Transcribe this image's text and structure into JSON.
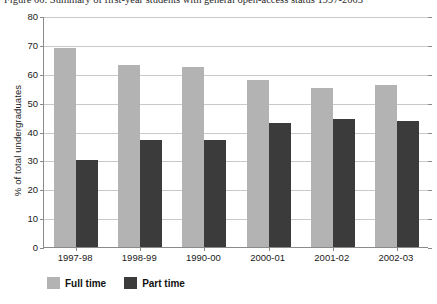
{
  "caption": {
    "text": "Figure 00. Summary of first-year students with general open-access status 1997-2003"
  },
  "legend": {
    "position": "bottom-left",
    "items": [
      {
        "label": "Full time",
        "color": "#b3b3b3",
        "swatch_name": "full-time"
      },
      {
        "label": "Part time",
        "color": "#3b3b3b",
        "swatch_name": "part-time"
      }
    ]
  },
  "axes": {
    "ylabel": "% of total undergraduates",
    "xlabel": "",
    "yticks": [
      "80",
      "70",
      "60",
      "50",
      "40",
      "30",
      "20",
      "10",
      "0"
    ]
  },
  "chart_data": {
    "type": "bar",
    "title": "",
    "xlabel": "",
    "ylabel": "% of total undergraduates",
    "ylim": [
      0,
      80
    ],
    "ytick_step": 10,
    "grid": true,
    "legend_position": "bottom-left",
    "categories": [
      "1997-98",
      "1998-99",
      "1990-00",
      "2000-01",
      "2001-02",
      "2002-03"
    ],
    "series": [
      {
        "name": "Full time",
        "color": "#b3b3b3",
        "values": [
          69,
          63,
          62.5,
          58,
          55,
          56
        ]
      },
      {
        "name": "Part time",
        "color": "#3b3b3b",
        "values": [
          30,
          37,
          37,
          43,
          44.5,
          43.5
        ]
      }
    ]
  }
}
